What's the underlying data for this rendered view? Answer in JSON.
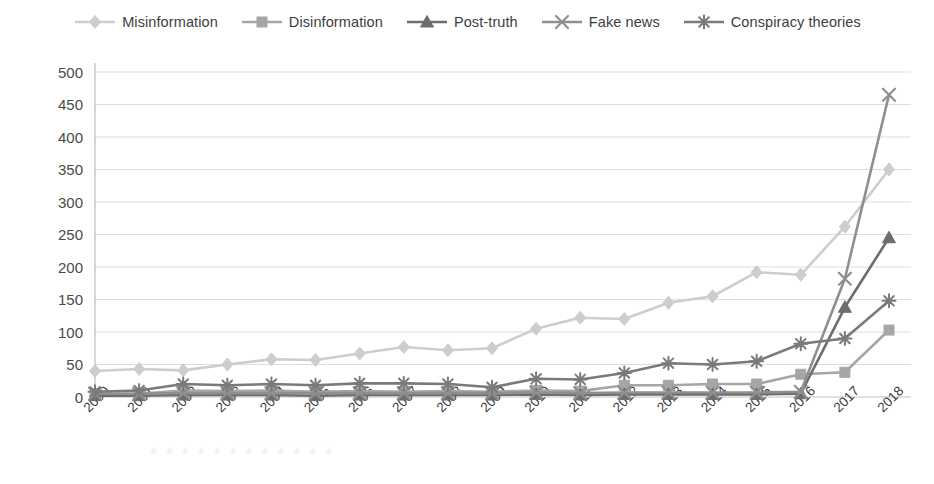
{
  "chart_data": {
    "type": "line",
    "title": "",
    "xlabel": "",
    "ylabel": "",
    "ylim": [
      0,
      500
    ],
    "ytick_step": 50,
    "grid": true,
    "legend_position": "top-center",
    "categories": [
      "2000",
      "2001",
      "2002",
      "2003",
      "2004",
      "2005",
      "2006",
      "2007",
      "2008",
      "2009",
      "2010",
      "2011",
      "2012",
      "2013",
      "2014",
      "2015",
      "2016",
      "2017",
      "2018"
    ],
    "yticks": [
      "500",
      "450",
      "400",
      "350",
      "300",
      "250",
      "200",
      "150",
      "100",
      "50",
      "0"
    ],
    "series": [
      {
        "name": "Misinformation",
        "marker": "diamond",
        "color": "#cdcdcd",
        "values": [
          40,
          43,
          41,
          50,
          58,
          57,
          67,
          77,
          72,
          75,
          105,
          122,
          120,
          145,
          155,
          192,
          188,
          262,
          350
        ]
      },
      {
        "name": "Disinformation",
        "marker": "square",
        "color": "#a6a6a6",
        "values": [
          5,
          5,
          10,
          9,
          10,
          8,
          9,
          8,
          9,
          8,
          10,
          9,
          18,
          18,
          20,
          20,
          35,
          38,
          103
        ]
      },
      {
        "name": "Post-truth",
        "marker": "triangle",
        "color": "#6d6d6d",
        "values": [
          2,
          2,
          3,
          3,
          3,
          2,
          3,
          3,
          3,
          3,
          4,
          3,
          4,
          4,
          4,
          4,
          5,
          138,
          245
        ]
      },
      {
        "name": "Fake news",
        "marker": "cross",
        "color": "#8f8f8f",
        "values": [
          5,
          5,
          6,
          6,
          6,
          6,
          6,
          6,
          6,
          6,
          7,
          6,
          7,
          7,
          7,
          7,
          8,
          182,
          465
        ]
      },
      {
        "name": "Conspiracy theories",
        "marker": "asterisk",
        "color": "#7a7a7a",
        "values": [
          8,
          10,
          20,
          18,
          20,
          18,
          21,
          21,
          20,
          15,
          28,
          27,
          37,
          52,
          50,
          55,
          82,
          90,
          148
        ]
      }
    ]
  },
  "watermark": {
    "text": "• • • • • • • • • • • •"
  }
}
